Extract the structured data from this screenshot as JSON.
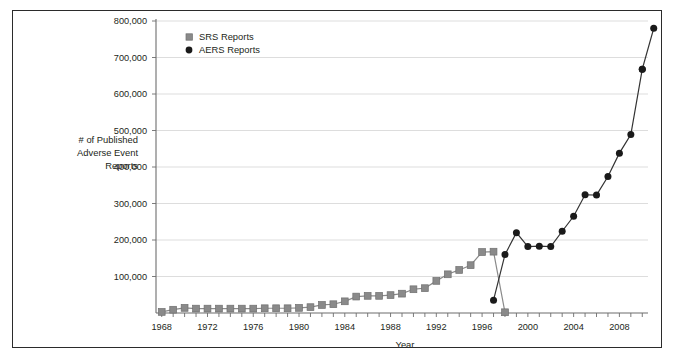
{
  "chart_data": {
    "type": "line",
    "title": "",
    "xlabel": "Year",
    "ylabel": "# of Published Adverse Event Reports",
    "ylabel_lines": [
      "# of Published",
      "Adverse Event",
      "Reports"
    ],
    "grid": true,
    "legend_position": "top-left-inside",
    "xlim": [
      1967.5,
      2010.5
    ],
    "ylim": [
      0,
      800000
    ],
    "ytick_labels": [
      "800,000",
      "700,000",
      "600,000",
      "500,000",
      "400,000",
      "300,000",
      "200,000",
      "100,000"
    ],
    "ytick_values": [
      800000,
      700000,
      600000,
      500000,
      400000,
      300000,
      200000,
      100000
    ],
    "xtick_labels": [
      "1968",
      "1972",
      "1976",
      "1980",
      "1984",
      "1988",
      "1992",
      "1996",
      "2000",
      "2004",
      "2008"
    ],
    "xtick_values": [
      1968,
      1972,
      1976,
      1980,
      1984,
      1988,
      1992,
      1996,
      2000,
      2004,
      2008
    ],
    "xtick_minor_values": [
      1968,
      1969,
      1970,
      1971,
      1972,
      1973,
      1974,
      1975,
      1976,
      1977,
      1978,
      1979,
      1980,
      1981,
      1982,
      1983,
      1984,
      1985,
      1986,
      1987,
      1988,
      1989,
      1990,
      1991,
      1992,
      1993,
      1994,
      1995,
      1996,
      1997,
      1998,
      1999,
      2000,
      2001,
      2002,
      2003,
      2004,
      2005,
      2006,
      2007,
      2008,
      2009,
      2010
    ],
    "series": [
      {
        "name": "SRS Reports",
        "marker": "square",
        "color": "#8a8a8a",
        "line_color": "#8a8a8a",
        "x": [
          1968,
          1969,
          1970,
          1971,
          1972,
          1973,
          1974,
          1975,
          1976,
          1977,
          1978,
          1979,
          1980,
          1981,
          1982,
          1983,
          1984,
          1985,
          1986,
          1987,
          1988,
          1989,
          1990,
          1991,
          1992,
          1993,
          1994,
          1995,
          1996,
          1997,
          1998
        ],
        "values": [
          3000,
          9000,
          14000,
          12000,
          12000,
          12000,
          12000,
          12000,
          12000,
          13000,
          13000,
          13000,
          14000,
          16000,
          22000,
          24000,
          32000,
          45000,
          47000,
          47000,
          49000,
          53000,
          65000,
          68000,
          88000,
          106000,
          118000,
          131000,
          167000,
          168000,
          2000
        ]
      },
      {
        "name": "AERS Reports",
        "marker": "circle",
        "color": "#1a1a1a",
        "line_color": "#333333",
        "x": [
          1997,
          1998,
          1999,
          2000,
          2001,
          2002,
          2003,
          2004,
          2005,
          2006,
          2007,
          2008,
          2009,
          2010
        ],
        "values": [
          35000,
          160000,
          220000,
          182000,
          183000,
          182000,
          224000,
          265000,
          324000,
          323000,
          374000,
          438000,
          489000,
          668000
        ]
      },
      {
        "name": "AERS Reports tail",
        "marker": "circle",
        "color": "#1a1a1a",
        "line_color": "#333333",
        "x": [
          2010,
          2011
        ],
        "values": [
          668000,
          780000
        ]
      }
    ],
    "legend": [
      {
        "label": "SRS Reports",
        "marker": "square",
        "color": "#8a8a8a"
      },
      {
        "label": "AERS Reports",
        "marker": "circle",
        "color": "#1a1a1a"
      }
    ]
  },
  "colors": {
    "frame": "#2b2b2b",
    "axis": "#6d6d6d",
    "grid": "#d9d9d9",
    "srs": "#8a8a8a",
    "aers": "#1a1a1a",
    "text": "#231f20"
  }
}
